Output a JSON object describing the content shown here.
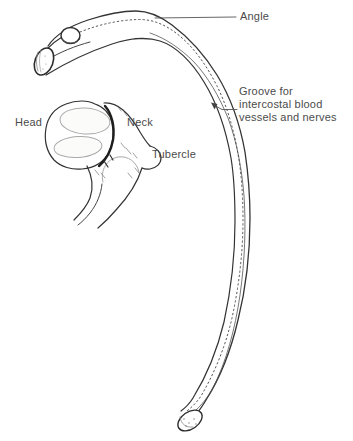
{
  "figure": {
    "labels": {
      "angle": "Angle",
      "groove": "Groove for\nintercostal blood\nvessels and nerves",
      "head": "Head",
      "neck": "Neck",
      "tubercle": "Tubercle"
    },
    "colors": {
      "background": "#ffffff",
      "outline": "#333333",
      "shading": "#1e1e1e",
      "light_detail": "#aaaaaa",
      "stipple": "#555555",
      "text": "#4b4b4b"
    }
  }
}
